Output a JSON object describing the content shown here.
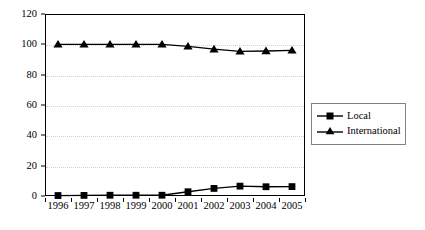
{
  "chart_data": {
    "type": "line",
    "title": "",
    "xlabel": "",
    "ylabel": "",
    "categories": [
      "1996",
      "1997",
      "1998",
      "1999",
      "2000",
      "2001",
      "2002",
      "2003",
      "2004",
      "2005"
    ],
    "series": [
      {
        "name": "Local",
        "marker": "square",
        "values": [
          0.3,
          0.4,
          0.5,
          0.5,
          0.5,
          2.8,
          5.0,
          6.5,
          6.1,
          6.2
        ]
      },
      {
        "name": "International",
        "marker": "triangle",
        "values": [
          100,
          100,
          100,
          100,
          100,
          98.7,
          96.8,
          95.4,
          95.6,
          96.0
        ]
      }
    ],
    "ylim": [
      0,
      120
    ],
    "yticks": [
      0,
      20,
      40,
      60,
      80,
      100,
      120
    ],
    "ytick_labels": [
      "0",
      "20",
      "40",
      "60",
      "80",
      "100",
      "120"
    ],
    "grid": "horizontal-dotted",
    "legend_position": "right-middle",
    "colors": {
      "series_line": "#000000",
      "grid": "#d2d2d2",
      "axis": "#000000",
      "background": "#ffffff"
    }
  },
  "legend": {
    "entries": [
      {
        "label": "Local",
        "marker": "square-marker"
      },
      {
        "label": "International",
        "marker": "triangle-marker"
      }
    ]
  }
}
